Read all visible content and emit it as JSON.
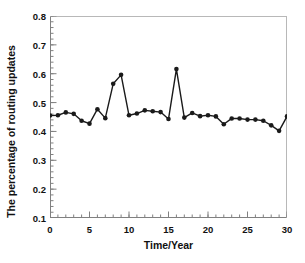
{
  "chart_data": {
    "type": "line",
    "title": "",
    "xlabel": "Time/Year",
    "ylabel": "The percentage of routing updates",
    "xlim": [
      0,
      30
    ],
    "ylim": [
      0.1,
      0.8
    ],
    "xticks": [
      0,
      5,
      10,
      15,
      20,
      25,
      30
    ],
    "xtick_labels": [
      "0",
      "5",
      "10",
      "15",
      "20",
      "25",
      "30"
    ],
    "yticks": [
      0.1,
      0.2,
      0.3,
      0.4,
      0.5,
      0.6,
      0.7,
      0.8
    ],
    "ytick_labels": [
      "0.1",
      "0.2",
      "0.3",
      "0.4",
      "0.5",
      "0.6",
      "0.7",
      "0.8"
    ],
    "x_minor_tick_step": 1,
    "y_minor_tick_step": 0.02,
    "grid": false,
    "legend": null,
    "marker": "circle-filled",
    "line_color": "#1a1a1a",
    "marker_color": "#1a1a1a",
    "axis_color": "#808080",
    "background": "#ffffff",
    "x": [
      0,
      1,
      2,
      3,
      4,
      5,
      6,
      7,
      8,
      9,
      10,
      11,
      12,
      13,
      14,
      15,
      16,
      17,
      18,
      19,
      20,
      21,
      22,
      23,
      24,
      25,
      26,
      27,
      28,
      29,
      30
    ],
    "values": [
      0.455,
      0.456,
      0.466,
      0.461,
      0.437,
      0.427,
      0.477,
      0.446,
      0.565,
      0.596,
      0.456,
      0.462,
      0.473,
      0.47,
      0.467,
      0.443,
      0.616,
      0.448,
      0.464,
      0.453,
      0.456,
      0.452,
      0.425,
      0.445,
      0.445,
      0.441,
      0.441,
      0.437,
      0.421,
      0.402,
      0.452
    ],
    "series": [
      {
        "name": "routing updates",
        "values": [
          0.455,
          0.456,
          0.466,
          0.461,
          0.437,
          0.427,
          0.477,
          0.446,
          0.565,
          0.596,
          0.456,
          0.462,
          0.473,
          0.47,
          0.467,
          0.443,
          0.616,
          0.448,
          0.464,
          0.453,
          0.456,
          0.452,
          0.425,
          0.445,
          0.445,
          0.441,
          0.441,
          0.437,
          0.421,
          0.402,
          0.452
        ]
      }
    ]
  }
}
